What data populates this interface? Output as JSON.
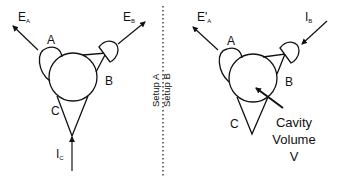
{
  "setup_a": {
    "label": "Setup A",
    "port_a": "A",
    "port_b": "B",
    "port_c": "C",
    "emission_a": {
      "main": "E",
      "sub": "A"
    },
    "emission_b": {
      "main": "E",
      "sub": "B"
    },
    "input_c": {
      "main": "I",
      "sub": "C"
    }
  },
  "setup_b": {
    "label": "Setup B",
    "port_a": "A",
    "port_b": "B",
    "port_c": "C",
    "emission_a": {
      "main": "E'",
      "sub": "A"
    },
    "input_b": {
      "main": "I",
      "sub": "B"
    },
    "cavity_line1": "Cavity",
    "cavity_line2": "Volume",
    "cavity_line3": "V"
  },
  "colors": {
    "stroke": "#111111",
    "background": "#ffffff"
  }
}
